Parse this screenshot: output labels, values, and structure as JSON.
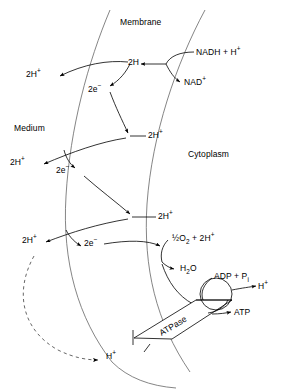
{
  "figure": {
    "type": "biochemical-schematic"
  },
  "compartments": {
    "membrane": "Membrane",
    "medium": "Medium",
    "cytoplasm": "Cytoplasm"
  },
  "loops": [
    {
      "id": "loop-1",
      "carrier": "2H",
      "electrons": "2e",
      "electron_charge": "−",
      "protons_out": "2H",
      "protons_out_charge": "+",
      "donor": "NADH + H",
      "donor_charge": "+",
      "product": "NAD",
      "product_charge": "+"
    },
    {
      "id": "loop-2",
      "carrier": "2H",
      "carrier_charge": "+",
      "electrons": "2e",
      "electron_charge": "−",
      "protons_out": "2H",
      "protons_out_charge": "+"
    },
    {
      "id": "loop-3",
      "carrier": "2H",
      "carrier_charge": "+",
      "electrons": "2e",
      "electron_charge": "−",
      "protons_out": "2H",
      "protons_out_charge": "+"
    }
  ],
  "terminal": {
    "oxygen_half": "½",
    "oxygen": "O",
    "oxygen_sub": "2",
    "oxygen_plus": " + 2H",
    "oxygen_charge": "+",
    "water_h": "H",
    "water_sub": "2",
    "water_o": "O"
  },
  "atpase": {
    "label": "ATPase",
    "substrate": "ADP + P",
    "substrate_sub": "i",
    "product": "ATP",
    "proton_out": "H",
    "proton_out_charge": "+",
    "proton_in": "H",
    "proton_in_charge": "+"
  },
  "style": {
    "line": "#000000",
    "membrane_line": "#555555",
    "dashed": "#555555"
  }
}
